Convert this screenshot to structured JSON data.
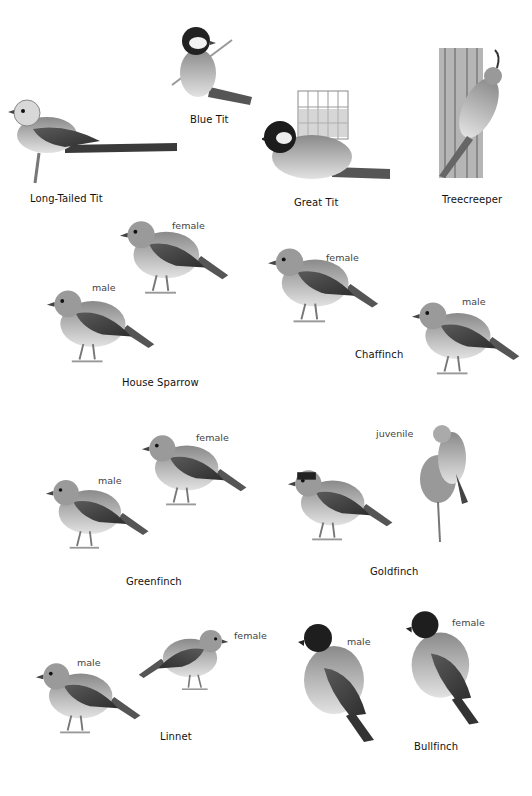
{
  "species": [
    {
      "name": "Long-Tailed Tit",
      "variants": []
    },
    {
      "name": "Blue Tit",
      "variants": []
    },
    {
      "name": "Great Tit",
      "variants": []
    },
    {
      "name": "Treecreeper",
      "variants": []
    },
    {
      "name": "House Sparrow",
      "variants": [
        "female",
        "male"
      ]
    },
    {
      "name": "Chaffinch",
      "variants": [
        "female",
        "male"
      ]
    },
    {
      "name": "Greenfinch",
      "variants": [
        "female",
        "male"
      ]
    },
    {
      "name": "Goldfinch",
      "variants": [
        "juvenile"
      ]
    },
    {
      "name": "Linnet",
      "variants": [
        "male",
        "female"
      ]
    },
    {
      "name": "Bullfinch",
      "variants": [
        "male",
        "female"
      ]
    }
  ],
  "colors": {
    "background": "#ffffff",
    "ink": "#1a1a1a",
    "shade_dark": "#3a3a3a",
    "shade_mid": "#8a8a8a",
    "shade_light": "#cfcfcf"
  }
}
